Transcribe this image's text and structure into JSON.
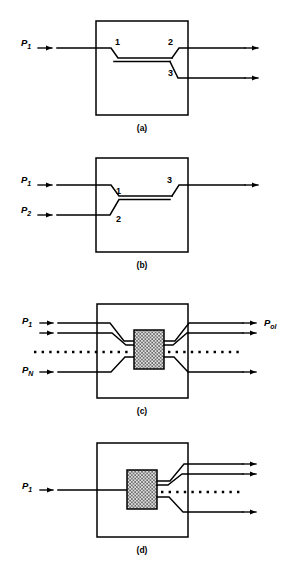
{
  "figure": {
    "line_color": "#000000",
    "background": "#ffffff",
    "mix_fill": "#d9d9d9",
    "panels": [
      {
        "id": "a",
        "caption": "(a)",
        "description": "Single input splits into two outputs via directional coupler",
        "inputs": [
          {
            "label": "P",
            "sub": "1"
          }
        ],
        "outputs": [
          {
            "label": "",
            "sub": ""
          },
          {
            "label": "",
            "sub": ""
          }
        ],
        "port_numbers": [
          "1",
          "2",
          "3"
        ]
      },
      {
        "id": "b",
        "caption": "(b)",
        "description": "Two inputs combine into a single output",
        "inputs": [
          {
            "label": "P",
            "sub": "1"
          },
          {
            "label": "P",
            "sub": "2"
          }
        ],
        "outputs": [
          {
            "label": "",
            "sub": ""
          }
        ],
        "port_numbers": [
          "1",
          "2",
          "3"
        ]
      },
      {
        "id": "c",
        "caption": "(c)",
        "description": "N inputs combine through mixing region into N outputs",
        "inputs": [
          {
            "label": "P",
            "sub": "1"
          },
          {
            "label": "P",
            "sub": "N"
          }
        ],
        "outputs": [
          {
            "label": "P",
            "sub": "ol"
          }
        ],
        "port_numbers": []
      },
      {
        "id": "d",
        "caption": "(d)",
        "description": "Single input splits through mixing region into N outputs",
        "inputs": [
          {
            "label": "P",
            "sub": "1"
          }
        ],
        "outputs": [
          {
            "label": "",
            "sub": ""
          }
        ],
        "port_numbers": []
      }
    ]
  }
}
